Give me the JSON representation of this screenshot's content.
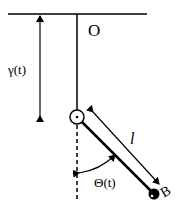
{
  "diagram": {
    "labels": {
      "pivot": "O",
      "displacement": "γ(t)",
      "angle": "Θ(t)",
      "length": "l",
      "bob": "B"
    },
    "colors": {
      "stroke": "#000000",
      "background": "#ffffff"
    }
  }
}
